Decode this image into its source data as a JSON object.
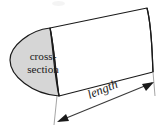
{
  "figure": {
    "name": "prism-cross-section-diagram",
    "background_color": "#ffffff",
    "outline_color": "#1a1a1a",
    "cross_section_fill": "#d6d6d6",
    "body_fill": "#ffffff",
    "labels": {
      "cross_section_line1": "cross-",
      "cross_section_line2": "section",
      "length": "length"
    },
    "dimension": {
      "arrow_name": "length-dimension-arrow",
      "style": "double-headed"
    }
  }
}
